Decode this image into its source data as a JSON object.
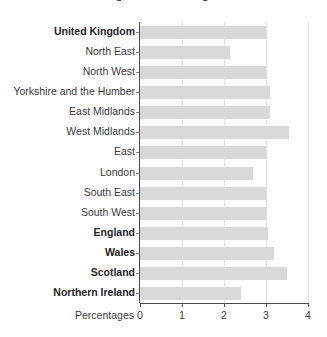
{
  "chart_data": {
    "type": "bar",
    "orientation": "horizontal",
    "title": "Figure 1: Percentages",
    "xlabel": "Percentages",
    "ylabel": "",
    "xlim": [
      0,
      4
    ],
    "xticks": [
      "0",
      "1",
      "2",
      "3",
      "4"
    ],
    "grid": true,
    "legend": null,
    "bar_color": "#d9d9d9",
    "categories": [
      "United Kingdom",
      "North East",
      "North West",
      "Yorkshire and the Humber",
      "East Midlands",
      "West Midlands",
      "East",
      "London",
      "South East",
      "South West",
      "England",
      "Wales",
      "Scotland",
      "Northern Ireland"
    ],
    "values": [
      3.0,
      2.15,
      3.0,
      3.1,
      3.1,
      3.55,
      3.0,
      2.7,
      3.0,
      3.0,
      3.05,
      3.2,
      3.5,
      2.4
    ],
    "emphasised_categories": [
      "United Kingdom",
      "England",
      "Wales",
      "Scotland",
      "Northern Ireland"
    ]
  }
}
